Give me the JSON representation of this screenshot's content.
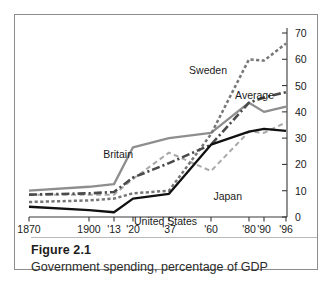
{
  "figure": {
    "number": "Figure 2.1",
    "caption": "Government spending, percentage of GDP"
  },
  "chart_data": {
    "type": "line",
    "title": "Government spending, percentage of GDP",
    "xlabel": "",
    "ylabel": "",
    "ylim": [
      0,
      70
    ],
    "yticks": [
      0,
      10,
      20,
      30,
      40,
      50,
      60,
      70
    ],
    "ytick_labels": [
      "0",
      "10",
      "20",
      "30",
      "40",
      "50",
      "60",
      "70"
    ],
    "yaxis_position": "right",
    "grid": false,
    "legend": "inline-annotations",
    "x": [
      "1870",
      "1900",
      "'13",
      "'20",
      "'37",
      "'60",
      "'80",
      "'90",
      "'96"
    ],
    "xtick_labels": [
      "1870",
      "1900",
      "'13",
      "'20",
      "'37",
      "'60",
      "'80",
      "'90",
      "'96"
    ],
    "series": [
      {
        "name": "Britain",
        "label": "Britain",
        "color": "#8e8e8e",
        "style": "solid",
        "values": [
          10.0,
          11.5,
          12.5,
          26.5,
          30.0,
          32.0,
          43.5,
          40.0,
          42.0
        ]
      },
      {
        "name": "Average",
        "label": "Average",
        "color": "#4a4a4a",
        "style": "dash-dot",
        "values": [
          8.5,
          9.0,
          9.5,
          15.0,
          20.5,
          27.5,
          43.5,
          45.5,
          47.5
        ]
      },
      {
        "name": "Sweden",
        "label": "Sweden",
        "color": "#777777",
        "style": "dotted",
        "values": [
          5.7,
          6.3,
          7.0,
          9.0,
          10.0,
          31.5,
          60.0,
          59.5,
          66.0
        ]
      },
      {
        "name": "Japan",
        "label": "Japan",
        "color": "#a9a9a9",
        "style": "dashed",
        "values": [
          8.5,
          8.5,
          8.5,
          14.5,
          24.5,
          17.5,
          32.5,
          32.0,
          36.0
        ]
      },
      {
        "name": "United States",
        "label": "United States",
        "color": "#111111",
        "style": "solid",
        "values": [
          3.9,
          2.6,
          1.8,
          7.0,
          8.8,
          27.5,
          32.5,
          33.5,
          32.8
        ]
      }
    ],
    "annotations": [
      {
        "text": "Sweden",
        "x": 212,
        "y": 59
      },
      {
        "text": "Average",
        "x": 259,
        "y": 84
      },
      {
        "text": "Britain",
        "x": 118,
        "y": 143
      },
      {
        "text": "Japan",
        "x": 227,
        "y": 185
      },
      {
        "text": "United States",
        "x": 182,
        "y": 210
      }
    ]
  }
}
